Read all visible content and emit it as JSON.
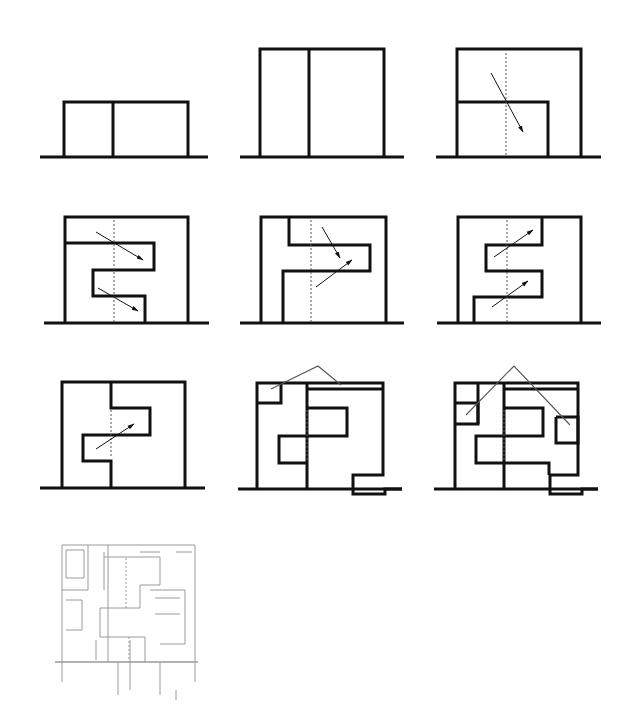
{
  "figure": {
    "title": "Section diagrams: evolution of split-level spatial configuration",
    "background": "#ffffff",
    "stroke_color": "#111111",
    "thin_color": "#555555",
    "faded_color": "#9a9a9a"
  },
  "chart_data": {
    "type": "diagram",
    "panels": [
      {
        "id": "p1",
        "label": "Two low volumes",
        "ground": [
          [
            40,
            157
          ],
          [
            208,
            157
          ]
        ],
        "thick": [
          [
            [
              64,
              157
            ],
            [
              64,
              102
            ],
            [
              188,
              102
            ],
            [
              188,
              157
            ]
          ],
          [
            [
              113,
              102
            ],
            [
              113,
              157
            ]
          ]
        ],
        "dashed": [],
        "arrows": [],
        "thin": []
      },
      {
        "id": "p2",
        "label": "Two tall volumes",
        "ground": [
          [
            240,
            157
          ],
          [
            404,
            157
          ]
        ],
        "thick": [
          [
            [
              260,
              157
            ],
            [
              260,
              49
            ],
            [
              384,
              49
            ],
            [
              384,
              157
            ]
          ],
          [
            [
              309,
              49
            ],
            [
              309,
              157
            ]
          ]
        ],
        "dashed": [],
        "arrows": [],
        "thin": []
      },
      {
        "id": "p3",
        "label": "Nested volume with diagonal view",
        "ground": [
          [
            436,
            157
          ],
          [
            601,
            157
          ]
        ],
        "thick": [
          [
            [
              457,
              157
            ],
            [
              457,
              49
            ],
            [
              581,
              49
            ],
            [
              581,
              157
            ]
          ],
          [
            [
              457,
              102
            ],
            [
              548,
              102
            ],
            [
              548,
              157
            ]
          ]
        ],
        "dashed": [
          [
            [
              506,
              53
            ],
            [
              506,
              157
            ]
          ]
        ],
        "arrows": [
          [
            [
              491,
              73
            ],
            [
              523,
              132
            ]
          ]
        ],
        "thin": []
      },
      {
        "id": "p4",
        "label": "Stacked split levels, descending views",
        "ground": [
          [
            44,
            323
          ],
          [
            209,
            323
          ]
        ],
        "thick": [
          [
            [
              65,
              323
            ],
            [
              65,
              217
            ],
            [
              188,
              217
            ],
            [
              188,
              323
            ]
          ],
          [
            [
              65,
              243
            ],
            [
              154,
              243
            ],
            [
              154,
              270
            ],
            [
              93,
              270
            ],
            [
              93,
              296
            ],
            [
              145,
              296
            ],
            [
              145,
              323
            ]
          ]
        ],
        "dashed": [
          [
            [
              114,
              220
            ],
            [
              114,
              323
            ]
          ]
        ],
        "arrows": [
          [
            [
              96,
              232
            ],
            [
              143,
              260
            ]
          ],
          [
            [
              98,
              288
            ],
            [
              138,
              311
            ]
          ]
        ],
        "thin": []
      },
      {
        "id": "p5",
        "label": "Interlocked levels, crossing views",
        "ground": [
          [
            240,
            323
          ],
          [
            404,
            323
          ]
        ],
        "thick": [
          [
            [
              261,
              323
            ],
            [
              261,
              217
            ],
            [
              386,
              217
            ],
            [
              386,
              323
            ]
          ],
          [
            [
              289,
              217
            ],
            [
              289,
              245
            ],
            [
              370,
              245
            ],
            [
              370,
              271
            ],
            [
              283,
              271
            ],
            [
              283,
              323
            ]
          ]
        ],
        "dashed": [
          [
            [
              311,
              220
            ],
            [
              311,
              323
            ]
          ]
        ],
        "arrows": [
          [
            [
              322,
              227
            ],
            [
              340,
              258
            ]
          ],
          [
            [
              316,
              287
            ],
            [
              352,
              260
            ]
          ]
        ],
        "thin": []
      },
      {
        "id": "p6",
        "label": "Serpentine levels, ascending views",
        "ground": [
          [
            437,
            323
          ],
          [
            601,
            323
          ]
        ],
        "thick": [
          [
            [
              458,
              323
            ],
            [
              458,
              217
            ],
            [
              581,
              217
            ],
            [
              581,
              323
            ]
          ],
          [
            [
              542,
              217
            ],
            [
              542,
              245
            ],
            [
              486,
              245
            ],
            [
              486,
              271
            ],
            [
              542,
              271
            ],
            [
              542,
              297
            ],
            [
              474,
              297
            ],
            [
              474,
              323
            ]
          ]
        ],
        "dashed": [
          [
            [
              507,
              220
            ],
            [
              507,
              323
            ]
          ]
        ],
        "arrows": [
          [
            [
              494,
              257
            ],
            [
              533,
              230
            ]
          ],
          [
            [
              492,
              307
            ],
            [
              528,
              281
            ]
          ]
        ],
        "thin": []
      },
      {
        "id": "p7",
        "label": "Central void with single ascending view",
        "ground": [
          [
            40,
            488
          ],
          [
            205,
            488
          ]
        ],
        "thick": [
          [
            [
              62,
              488
            ],
            [
              62,
              382
            ],
            [
              185,
              382
            ],
            [
              185,
              488
            ]
          ],
          [
            [
              111,
              382
            ],
            [
              111,
              408
            ],
            [
              150,
              408
            ],
            [
              150,
              435
            ],
            [
              83,
              435
            ],
            [
              83,
              461
            ],
            [
              111,
              461
            ],
            [
              111,
              488
            ]
          ]
        ],
        "dashed": [
          [
            [
              111,
              410
            ],
            [
              111,
              458
            ]
          ]
        ],
        "arrows": [
          [
            [
              96,
              449
            ],
            [
              134,
              424
            ]
          ]
        ],
        "thin": []
      },
      {
        "id": "p8",
        "label": "Roof and lower additions with sightlines",
        "ground": [
          [
            238,
            489
          ],
          [
            402,
            489
          ]
        ],
        "thick": [
          [
            [
              257,
              489
            ],
            [
              257,
              383
            ],
            [
              383,
              383
            ],
            [
              383,
              475
            ],
            [
              353,
              475
            ],
            [
              353,
              494
            ],
            [
              385,
              494
            ],
            [
              385,
              489
            ],
            [
              402,
              489
            ]
          ],
          [
            [
              257,
              403
            ],
            [
              281,
              403
            ],
            [
              281,
              383
            ]
          ],
          [
            [
              307,
              383
            ],
            [
              307,
              489
            ]
          ],
          [
            [
              307,
              389
            ],
            [
              383,
              389
            ]
          ],
          [
            [
              307,
              408
            ],
            [
              347,
              408
            ],
            [
              347,
              436
            ],
            [
              279,
              436
            ],
            [
              279,
              463
            ],
            [
              307,
              463
            ]
          ]
        ],
        "dashed": [
          [
            [
              307,
              410
            ],
            [
              307,
              462
            ]
          ]
        ],
        "arrows": [],
        "thin": [
          [
            [
              271,
              389
            ],
            [
              318,
              366
            ],
            [
              341,
              385
            ]
          ]
        ]
      },
      {
        "id": "p9",
        "label": "Full composition with multiple sightlines",
        "ground": [
          [
            434,
            489
          ],
          [
            598,
            489
          ]
        ],
        "thick": [
          [
            [
              455,
              489
            ],
            [
              455,
              383
            ],
            [
              578,
              383
            ],
            [
              578,
              475
            ],
            [
              550,
              475
            ],
            [
              550,
              494
            ],
            [
              582,
              494
            ],
            [
              582,
              489
            ],
            [
              598,
              489
            ]
          ],
          [
            [
              455,
              403
            ],
            [
              478,
              403
            ],
            [
              478,
              424
            ],
            [
              455,
              424
            ]
          ],
          [
            [
              478,
              383
            ],
            [
              478,
              424
            ]
          ],
          [
            [
              504,
              383
            ],
            [
              504,
              489
            ]
          ],
          [
            [
              504,
              389
            ],
            [
              578,
              389
            ]
          ],
          [
            [
              504,
              408
            ],
            [
              543,
              408
            ],
            [
              543,
              436
            ],
            [
              476,
              436
            ],
            [
              476,
              463
            ],
            [
              549,
              463
            ],
            [
              549,
              475
            ]
          ],
          [
            [
              556,
              417
            ],
            [
              578,
              417
            ],
            [
              578,
              443
            ],
            [
              556,
              443
            ],
            [
              556,
              417
            ]
          ]
        ],
        "dashed": [
          [
            [
              504,
              410
            ],
            [
              504,
              462
            ]
          ]
        ],
        "arrows": [],
        "thin": [
          [
            [
              466,
              415
            ],
            [
              514,
              366
            ],
            [
              570,
              425
            ]
          ]
        ]
      },
      {
        "id": "p10",
        "label": "Detailed architectural section (faded)",
        "ground": [
          [
            55,
            662
          ],
          [
            198,
            662
          ]
        ],
        "thick": [],
        "dashed": [
          [
            [
              126,
              558
            ],
            [
              126,
              608
            ]
          ],
          [
            [
              129,
              637
            ],
            [
              129,
              662
            ]
          ]
        ],
        "arrows": [],
        "thin": [
          [
            [
              62,
              545
            ],
            [
              62,
              682
            ]
          ],
          [
            [
              62,
              545
            ],
            [
              195,
              545
            ]
          ],
          [
            [
              195,
              545
            ],
            [
              195,
              682
            ]
          ],
          [
            [
              88,
              545
            ],
            [
              88,
              590
            ]
          ],
          [
            [
              62,
              590
            ],
            [
              88,
              590
            ]
          ],
          [
            [
              66,
              550
            ],
            [
              84,
              550
            ],
            [
              84,
              578
            ],
            [
              66,
              578
            ],
            [
              66,
              550
            ]
          ],
          [
            [
              108,
              545
            ],
            [
              108,
              662
            ]
          ],
          [
            [
              104,
              552
            ],
            [
              104,
              590
            ]
          ],
          [
            [
              104,
              557
            ],
            [
              160,
              557
            ],
            [
              160,
              585
            ],
            [
              140,
              585
            ],
            [
              140,
              608
            ],
            [
              100,
              608
            ],
            [
              100,
              637
            ],
            [
              145,
              637
            ],
            [
              145,
              662
            ]
          ],
          [
            [
              150,
              590
            ],
            [
              185,
              590
            ],
            [
              185,
              644
            ],
            [
              160,
              644
            ]
          ],
          [
            [
              155,
              598
            ],
            [
              180,
              598
            ]
          ],
          [
            [
              155,
              614
            ],
            [
              180,
              614
            ]
          ],
          [
            [
              140,
              552
            ],
            [
              160,
              552
            ]
          ],
          [
            [
              176,
              552
            ],
            [
              192,
              552
            ]
          ],
          [
            [
              130,
              640
            ],
            [
              130,
              690
            ]
          ],
          [
            [
              160,
              662
            ],
            [
              160,
              695
            ]
          ],
          [
            [
              118,
              662
            ],
            [
              118,
              695
            ]
          ],
          [
            [
              66,
              600
            ],
            [
              82,
              600
            ],
            [
              82,
              630
            ],
            [
              66,
              630
            ]
          ],
          [
            [
              96,
              640
            ],
            [
              96,
              660
            ]
          ],
          [
            [
              176,
              690
            ],
            [
              176,
              700
            ]
          ]
        ]
      }
    ]
  }
}
